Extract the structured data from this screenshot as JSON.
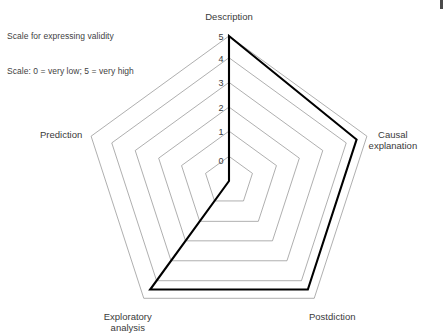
{
  "caption": {
    "line1": "Scale for expressing validity",
    "line2": "Scale: 0 = very low; 5 = very high"
  },
  "chart_data": {
    "type": "radar",
    "title": "",
    "categories": [
      "Description",
      "Causal explanation",
      "Postdiction",
      "Exploratory analysis",
      "Prediction"
    ],
    "values": [
      5,
      4.5,
      4.5,
      4.5,
      0
    ],
    "series": [
      {
        "name": "validity",
        "values": [
          5,
          4.5,
          4.5,
          4.5,
          0
        ]
      }
    ],
    "tick_labels": [
      "0",
      "1",
      "2",
      "3",
      "4",
      "5"
    ],
    "ticks": [
      0,
      1,
      2,
      3,
      4,
      5
    ],
    "rlim": [
      0,
      5
    ],
    "grid": true,
    "legend": "none",
    "scale_note": "0 = very low; 5 = very high",
    "grid_color": "#8d8d8d",
    "series_color": "#000000"
  },
  "geometry": {
    "center_x": 229,
    "center_y": 181,
    "radius": 145,
    "start_angle_deg": -90
  }
}
